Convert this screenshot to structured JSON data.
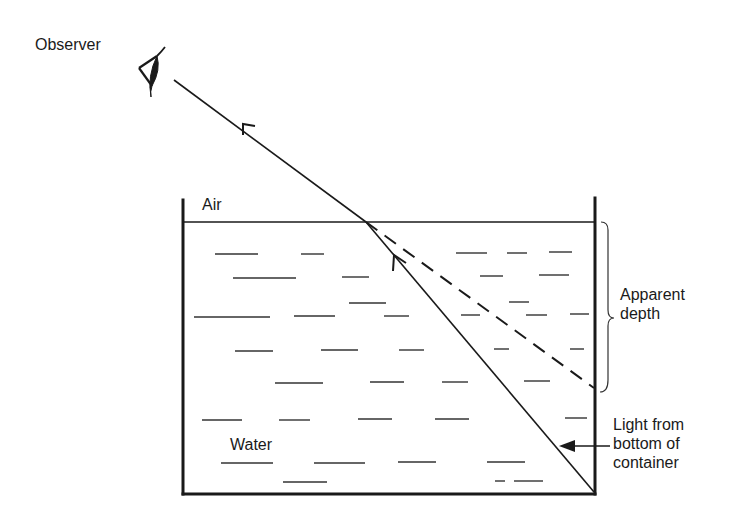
{
  "diagram": {
    "labels": {
      "observer": "Observer",
      "air": "Air",
      "water": "Water",
      "apparent_depth_line1": "Apparent",
      "apparent_depth_line2": "depth",
      "light_line1": "Light from",
      "light_line2": "bottom of",
      "light_line3": "container"
    },
    "icons": {
      "observer": "eye-icon"
    },
    "colors": {
      "ink": "#1a1a1a",
      "background": "#ffffff"
    }
  }
}
